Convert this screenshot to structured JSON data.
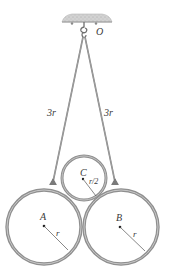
{
  "diagram": {
    "type": "mechanics-figure",
    "support": {
      "label": "O"
    },
    "cords": [
      {
        "id": "left-cord",
        "length_label": "3r"
      },
      {
        "id": "right-cord",
        "length_label": "3r"
      }
    ],
    "cylinders": [
      {
        "id": "A",
        "label": "A",
        "radius_label": "r"
      },
      {
        "id": "B",
        "label": "B",
        "radius_label": "r"
      },
      {
        "id": "C",
        "label": "C",
        "radius_label": "r/2"
      }
    ],
    "colors": {
      "ring": "#8f8f8f",
      "ring_inner": "#bdbdbd",
      "cord": "#7a7a7a",
      "ceiling": "#c9c9c9",
      "text": "#3a3a3a"
    }
  }
}
